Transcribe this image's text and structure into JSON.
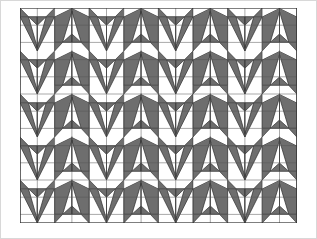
{
  "figure": {
    "title": "Origami tessellation crease pattern",
    "kind": "geometric-tessellation",
    "canvas": {
      "width": 317,
      "height": 239,
      "background": "#ffffff"
    },
    "plot_area": {
      "x": 20,
      "y": 8,
      "width": 277,
      "height": 215
    },
    "grid": {
      "columns": 16,
      "rows": 12,
      "cell_width": 17.3,
      "cell_height": 17.2,
      "line_color": "#4a4a4a",
      "line_width": 0.6,
      "visible": true
    },
    "palette": {
      "fill_dark": "#6e6e6e",
      "fill_light": "#ffffff",
      "fill_mid": "#8a8a8a",
      "stroke": "#2b2b2b",
      "grid": "#555555",
      "frame": "#bdbdbd",
      "background": "#ffffff"
    },
    "motif": {
      "name": "arrowhead-triangle-unit",
      "unit_columns": 4,
      "unit_rows": 2,
      "description": "Alternating up-pointing and down-pointing shaded triangle pairs forming a repeating banded tessellation"
    },
    "bands": [
      {
        "index": 0,
        "y_top": 8,
        "y_bottom": 51,
        "orientation": "up-down-alternating"
      },
      {
        "index": 1,
        "y_top": 51,
        "y_bottom": 94,
        "orientation": "up-down-alternating"
      },
      {
        "index": 2,
        "y_top": 94,
        "y_bottom": 137,
        "orientation": "up-down-alternating"
      },
      {
        "index": 3,
        "y_top": 137,
        "y_bottom": 180,
        "orientation": "up-down-alternating"
      },
      {
        "index": 4,
        "y_top": 180,
        "y_bottom": 223,
        "orientation": "up-down-alternating"
      }
    ]
  }
}
